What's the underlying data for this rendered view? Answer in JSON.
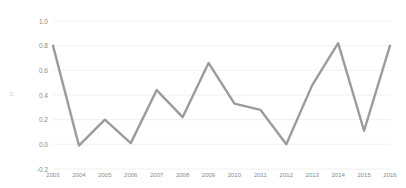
{
  "chart_data": {
    "type": "line",
    "title": "",
    "xlabel": "",
    "ylabel": "r²",
    "categories": [
      "2003",
      "2004",
      "2005",
      "2006",
      "2007",
      "2008",
      "2009",
      "2010",
      "2011",
      "2012",
      "2013",
      "2014",
      "2015",
      "2016"
    ],
    "values": [
      0.8,
      -0.01,
      0.2,
      0.01,
      0.44,
      0.22,
      0.66,
      0.33,
      0.28,
      0.0,
      0.48,
      0.82,
      0.11,
      0.8
    ],
    "series": [
      {
        "name": "r²",
        "values": [
          0.8,
          -0.01,
          0.2,
          0.01,
          0.44,
          0.22,
          0.66,
          0.33,
          0.28,
          0.0,
          0.48,
          0.82,
          0.11,
          0.8
        ]
      }
    ],
    "ylim": [
      -0.2,
      1.0
    ],
    "yticks": [
      "1.0",
      "0.8",
      "0.6",
      "0.4",
      "0.2",
      "0.0",
      "-0.2"
    ],
    "ytick_values": [
      1.0,
      0.8,
      0.6,
      0.4,
      0.2,
      0.0,
      -0.2
    ],
    "grid": true,
    "legend": false,
    "legend_position": "none",
    "line_color": "#9b9b9b",
    "grid_color": "#ececec",
    "background_color": "#ffffff",
    "tick_label_color": "#8a8a8a"
  }
}
